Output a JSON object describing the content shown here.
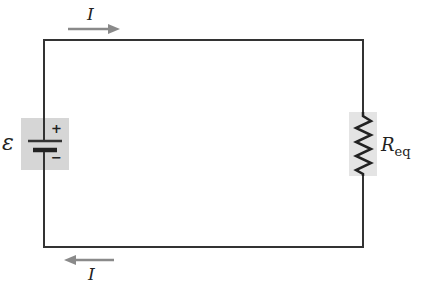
{
  "diagram": {
    "type": "circuit",
    "components": {
      "source": {
        "symbol": "ε",
        "plus": "+",
        "minus": "−"
      },
      "resistor": {
        "label_main": "R",
        "label_sub": "eq"
      }
    },
    "currents": {
      "top": {
        "label": "I",
        "direction": "right"
      },
      "bottom": {
        "label": "I",
        "direction": "left"
      }
    },
    "colors": {
      "wire": "#333333",
      "highlight": "#d4d4d4",
      "arrow": "#8a8a8a"
    }
  }
}
